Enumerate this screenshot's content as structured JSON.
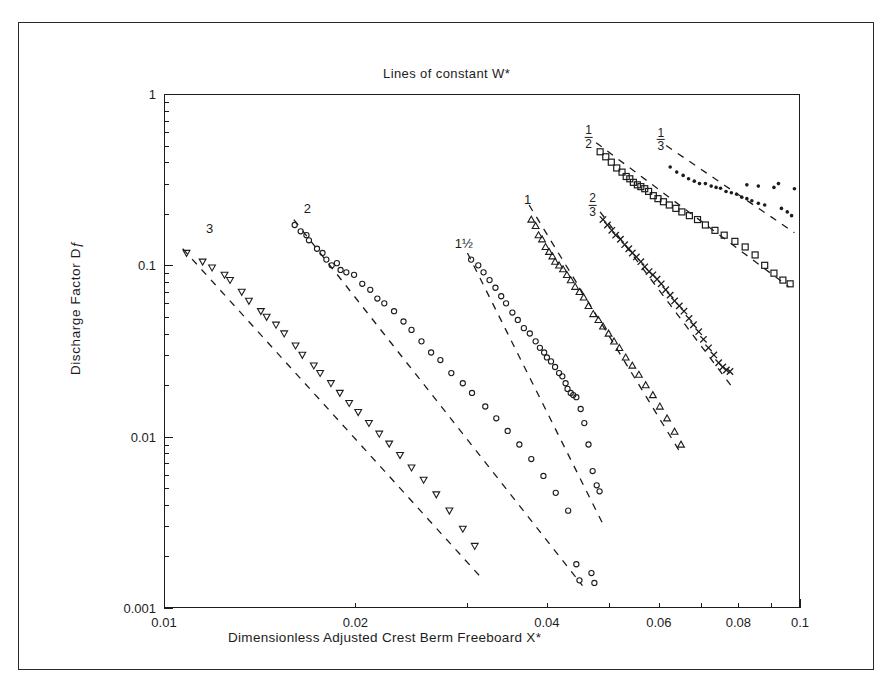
{
  "chart_data": {
    "type": "scatter",
    "title": "Lines of constant W*",
    "xlabel": "Dimensionless Adjusted Crest Berm Freeboard X*",
    "ylabel": "Discharge Factor Dƒ",
    "xscale": "log",
    "yscale": "log",
    "xlim": [
      0.01,
      0.1
    ],
    "ylim": [
      0.001,
      1
    ],
    "grid": false,
    "legend": "inline curve labels",
    "xticks": [
      "0.01",
      "0.02",
      "0.04",
      "0.06",
      "0.08",
      "0.1"
    ],
    "xtick_values": [
      0.01,
      0.02,
      0.04,
      0.06,
      0.08,
      0.1
    ],
    "yticks": [
      "1",
      "0.1",
      "0.01",
      "0.001"
    ],
    "ytick_values": [
      1,
      0.1,
      0.01,
      0.001
    ],
    "series": [
      {
        "name": "3",
        "label": "3",
        "label_text": "3",
        "marker": "triangle-down",
        "label_x": 0.0118,
        "label_y": 0.165,
        "fit_line": [
          [
            0.0107,
            0.125
          ],
          [
            0.0313,
            0.00155
          ]
        ],
        "points": [
          [
            0.01085,
            0.118
          ],
          [
            0.0115,
            0.105
          ],
          [
            0.0119,
            0.097
          ],
          [
            0.01245,
            0.088
          ],
          [
            0.0127,
            0.082
          ],
          [
            0.01325,
            0.07
          ],
          [
            0.0136,
            0.062
          ],
          [
            0.0142,
            0.054
          ],
          [
            0.0145,
            0.05
          ],
          [
            0.015,
            0.045
          ],
          [
            0.01545,
            0.04
          ],
          [
            0.0161,
            0.034
          ],
          [
            0.0165,
            0.03
          ],
          [
            0.0172,
            0.026
          ],
          [
            0.0176,
            0.0235
          ],
          [
            0.0183,
            0.0205
          ],
          [
            0.0189,
            0.018
          ],
          [
            0.01955,
            0.0157
          ],
          [
            0.0202,
            0.0139
          ],
          [
            0.021,
            0.012
          ],
          [
            0.0218,
            0.0104
          ],
          [
            0.0226,
            0.0091
          ],
          [
            0.0235,
            0.0078
          ],
          [
            0.0245,
            0.0066
          ],
          [
            0.0256,
            0.0056
          ],
          [
            0.0268,
            0.0046
          ],
          [
            0.0281,
            0.0037
          ],
          [
            0.0295,
            0.0029
          ],
          [
            0.0308,
            0.0023
          ]
        ]
      },
      {
        "name": "2",
        "label": "2",
        "label_text": "2",
        "marker": "circle",
        "label_x": 0.0168,
        "label_y": 0.215,
        "fit_line": [
          [
            0.016,
            0.185
          ],
          [
            0.0455,
            0.00135
          ]
        ],
        "points": [
          [
            0.01605,
            0.172
          ],
          [
            0.0164,
            0.158
          ],
          [
            0.01675,
            0.15
          ],
          [
            0.0169,
            0.14
          ],
          [
            0.0174,
            0.125
          ],
          [
            0.01775,
            0.118
          ],
          [
            0.018,
            0.108
          ],
          [
            0.01835,
            0.1
          ],
          [
            0.0187,
            0.103
          ],
          [
            0.01895,
            0.094
          ],
          [
            0.01935,
            0.091
          ],
          [
            0.0199,
            0.088
          ],
          [
            0.0205,
            0.078
          ],
          [
            0.0211,
            0.072
          ],
          [
            0.02165,
            0.064
          ],
          [
            0.0222,
            0.06
          ],
          [
            0.023,
            0.054
          ],
          [
            0.0238,
            0.047
          ],
          [
            0.0245,
            0.042
          ],
          [
            0.0254,
            0.036
          ],
          [
            0.0263,
            0.031
          ],
          [
            0.0272,
            0.028
          ],
          [
            0.0283,
            0.0235
          ],
          [
            0.0295,
            0.0205
          ],
          [
            0.0305,
            0.018
          ],
          [
            0.032,
            0.015
          ],
          [
            0.0333,
            0.0128
          ],
          [
            0.0347,
            0.0108
          ],
          [
            0.0362,
            0.009
          ],
          [
            0.0378,
            0.0074
          ],
          [
            0.0395,
            0.0059
          ],
          [
            0.0413,
            0.0047
          ],
          [
            0.0432,
            0.0037
          ],
          [
            0.0445,
            0.0018
          ],
          [
            0.047,
            0.0016
          ]
        ]
      },
      {
        "name": "1½",
        "label": "1½",
        "label_text": "1½",
        "marker": "circle",
        "label_x": 0.0296,
        "label_y": 0.135,
        "fit_line": [
          [
            0.03,
            0.118
          ],
          [
            0.0493,
            0.00295
          ]
        ],
        "points": [
          [
            0.0304,
            0.108
          ],
          [
            0.0312,
            0.1
          ],
          [
            0.0318,
            0.091
          ],
          [
            0.0325,
            0.082
          ],
          [
            0.0332,
            0.074
          ],
          [
            0.0339,
            0.066
          ],
          [
            0.0345,
            0.06
          ],
          [
            0.0353,
            0.053
          ],
          [
            0.036,
            0.048
          ],
          [
            0.0368,
            0.043
          ],
          [
            0.0376,
            0.04
          ],
          [
            0.0384,
            0.036
          ],
          [
            0.039,
            0.033
          ],
          [
            0.0396,
            0.031
          ],
          [
            0.04,
            0.029
          ],
          [
            0.0406,
            0.0275
          ],
          [
            0.0412,
            0.0255
          ],
          [
            0.0418,
            0.0235
          ],
          [
            0.0423,
            0.0225
          ],
          [
            0.0428,
            0.0205
          ],
          [
            0.0431,
            0.019
          ],
          [
            0.0436,
            0.018
          ],
          [
            0.044,
            0.0175
          ],
          [
            0.0445,
            0.017
          ],
          [
            0.0452,
            0.0145
          ],
          [
            0.0458,
            0.012
          ],
          [
            0.0465,
            0.009
          ],
          [
            0.0472,
            0.0063
          ],
          [
            0.0479,
            0.0052
          ],
          [
            0.0484,
            0.0048
          ],
          [
            0.045,
            0.00145
          ],
          [
            0.0475,
            0.0014
          ]
        ]
      },
      {
        "name": "1",
        "label": "1",
        "label_text": "1",
        "marker": "triangle-up",
        "label_x": 0.0373,
        "label_y": 0.245,
        "fit_line": [
          [
            0.0375,
            0.225
          ],
          [
            0.0652,
            0.0078
          ]
        ],
        "points": [
          [
            0.0378,
            0.185
          ],
          [
            0.0384,
            0.17
          ],
          [
            0.0388,
            0.15
          ],
          [
            0.0393,
            0.142
          ],
          [
            0.0398,
            0.128
          ],
          [
            0.0403,
            0.12
          ],
          [
            0.0408,
            0.113
          ],
          [
            0.0412,
            0.105
          ],
          [
            0.0418,
            0.1
          ],
          [
            0.0424,
            0.095
          ],
          [
            0.043,
            0.088
          ],
          [
            0.0436,
            0.082
          ],
          [
            0.0443,
            0.075
          ],
          [
            0.045,
            0.07
          ],
          [
            0.0457,
            0.065
          ],
          [
            0.0465,
            0.058
          ],
          [
            0.0473,
            0.052
          ],
          [
            0.0482,
            0.048
          ],
          [
            0.049,
            0.044
          ],
          [
            0.05,
            0.04
          ],
          [
            0.051,
            0.036
          ],
          [
            0.052,
            0.033
          ],
          [
            0.0532,
            0.029
          ],
          [
            0.0545,
            0.026
          ],
          [
            0.0558,
            0.023
          ],
          [
            0.0572,
            0.02
          ],
          [
            0.0587,
            0.0175
          ],
          [
            0.0602,
            0.015
          ],
          [
            0.0618,
            0.0128
          ],
          [
            0.0635,
            0.0107
          ],
          [
            0.065,
            0.009
          ]
        ]
      },
      {
        "name": "2/3",
        "label": "2/3",
        "label_text": "2⁄3",
        "marker": "cross",
        "label_x": 0.0472,
        "label_y": 0.225,
        "fit_line": [
          [
            0.0485,
            0.205
          ],
          [
            0.0778,
            0.02
          ]
        ],
        "points": [
          [
            0.049,
            0.185
          ],
          [
            0.0498,
            0.172
          ],
          [
            0.0506,
            0.16
          ],
          [
            0.0513,
            0.15
          ],
          [
            0.0522,
            0.142
          ],
          [
            0.053,
            0.132
          ],
          [
            0.0538,
            0.125
          ],
          [
            0.0545,
            0.118
          ],
          [
            0.0553,
            0.112
          ],
          [
            0.0562,
            0.105
          ],
          [
            0.057,
            0.098
          ],
          [
            0.0579,
            0.092
          ],
          [
            0.0587,
            0.088
          ],
          [
            0.0596,
            0.083
          ],
          [
            0.0605,
            0.078
          ],
          [
            0.0615,
            0.072
          ],
          [
            0.0625,
            0.067
          ],
          [
            0.0635,
            0.062
          ],
          [
            0.0646,
            0.058
          ],
          [
            0.0657,
            0.054
          ],
          [
            0.0669,
            0.049
          ],
          [
            0.068,
            0.045
          ],
          [
            0.0693,
            0.041
          ],
          [
            0.0705,
            0.037
          ],
          [
            0.0718,
            0.033
          ],
          [
            0.0732,
            0.03
          ],
          [
            0.0745,
            0.027
          ],
          [
            0.0756,
            0.0255
          ],
          [
            0.0766,
            0.0245
          ],
          [
            0.0776,
            0.024
          ]
        ]
      },
      {
        "name": "1/2",
        "label": "1/2",
        "label_text": "1⁄2",
        "marker": "square",
        "label_x": 0.0465,
        "label_y": 0.56,
        "fit_line": [
          [
            0.0478,
            0.52
          ],
          [
            0.096,
            0.075
          ]
        ],
        "points": [
          [
            0.0485,
            0.46
          ],
          [
            0.0495,
            0.43
          ],
          [
            0.0505,
            0.4
          ],
          [
            0.0515,
            0.37
          ],
          [
            0.0525,
            0.35
          ],
          [
            0.0533,
            0.33
          ],
          [
            0.054,
            0.32
          ],
          [
            0.0547,
            0.305
          ],
          [
            0.0555,
            0.295
          ],
          [
            0.0562,
            0.288
          ],
          [
            0.057,
            0.28
          ],
          [
            0.0578,
            0.27
          ],
          [
            0.0588,
            0.255
          ],
          [
            0.0598,
            0.245
          ],
          [
            0.061,
            0.235
          ],
          [
            0.0623,
            0.225
          ],
          [
            0.0638,
            0.215
          ],
          [
            0.0652,
            0.205
          ],
          [
            0.067,
            0.195
          ],
          [
            0.069,
            0.185
          ],
          [
            0.071,
            0.172
          ],
          [
            0.0735,
            0.16
          ],
          [
            0.076,
            0.15
          ],
          [
            0.079,
            0.138
          ],
          [
            0.082,
            0.128
          ],
          [
            0.085,
            0.115
          ],
          [
            0.088,
            0.1
          ],
          [
            0.091,
            0.09
          ],
          [
            0.094,
            0.082
          ],
          [
            0.0965,
            0.078
          ]
        ]
      },
      {
        "name": "1/3",
        "label": "1/3",
        "label_text": "1⁄3",
        "marker": "dot",
        "label_x": 0.0604,
        "label_y": 0.54,
        "fit_line": [
          [
            0.0616,
            0.5
          ],
          [
            0.098,
            0.155
          ]
        ],
        "points": [
          [
            0.0625,
            0.375
          ],
          [
            0.064,
            0.35
          ],
          [
            0.0655,
            0.335
          ],
          [
            0.0668,
            0.32
          ],
          [
            0.0682,
            0.31
          ],
          [
            0.0695,
            0.3
          ],
          [
            0.071,
            0.3
          ],
          [
            0.0725,
            0.29
          ],
          [
            0.0738,
            0.285
          ],
          [
            0.075,
            0.282
          ],
          [
            0.0765,
            0.27
          ],
          [
            0.078,
            0.265
          ],
          [
            0.0795,
            0.26
          ],
          [
            0.081,
            0.25
          ],
          [
            0.0825,
            0.245
          ],
          [
            0.084,
            0.238
          ],
          [
            0.086,
            0.23
          ],
          [
            0.088,
            0.225
          ],
          [
            0.0825,
            0.295
          ],
          [
            0.086,
            0.29
          ],
          [
            0.091,
            0.285
          ],
          [
            0.0935,
            0.215
          ],
          [
            0.0955,
            0.205
          ],
          [
            0.097,
            0.195
          ],
          [
            0.098,
            0.28
          ],
          [
            0.0925,
            0.3
          ]
        ]
      }
    ]
  }
}
